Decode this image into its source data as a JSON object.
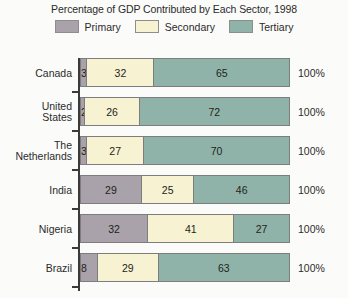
{
  "chart_data": {
    "type": "bar",
    "orientation": "horizontal",
    "stacked": true,
    "normalized": true,
    "title": "Percentage of GDP Contributed by Each Sector, 1998",
    "xlabel": "",
    "ylabel": "",
    "xlim": [
      0,
      100
    ],
    "grid": false,
    "legend_position": "top",
    "categories": [
      "Canada",
      "United\nStates",
      "The\nNetherlands",
      "India",
      "Nigeria",
      "Brazil"
    ],
    "series": [
      {
        "name": "Primary",
        "color": "#a9a2ab",
        "values": [
          3,
          2,
          3,
          29,
          32,
          8
        ]
      },
      {
        "name": "Secondary",
        "color": "#f7f2d2",
        "values": [
          32,
          26,
          27,
          25,
          41,
          29
        ]
      },
      {
        "name": "Tertiary",
        "color": "#8fb3a8",
        "values": [
          65,
          72,
          70,
          46,
          27,
          63
        ]
      }
    ],
    "row_totals": [
      "100%",
      "100%",
      "100%",
      "100%",
      "100%",
      "100%"
    ]
  },
  "legend": {
    "items": [
      {
        "label": "Primary",
        "color": "#a9a2ab"
      },
      {
        "label": "Secondary",
        "color": "#f7f2d2"
      },
      {
        "label": "Tertiary",
        "color": "#8fb3a8"
      }
    ]
  },
  "rows": [
    {
      "label_line1": "Canada",
      "label_line2": "",
      "total": "100%",
      "segments": [
        {
          "sector": "Primary",
          "value": "3",
          "pct": 3
        },
        {
          "sector": "Secondary",
          "value": "32",
          "pct": 32
        },
        {
          "sector": "Tertiary",
          "value": "65",
          "pct": 65
        }
      ]
    },
    {
      "label_line1": "United",
      "label_line2": "States",
      "total": "100%",
      "segments": [
        {
          "sector": "Primary",
          "value": "2",
          "pct": 2
        },
        {
          "sector": "Secondary",
          "value": "26",
          "pct": 26
        },
        {
          "sector": "Tertiary",
          "value": "72",
          "pct": 72
        }
      ]
    },
    {
      "label_line1": "The",
      "label_line2": "Netherlands",
      "total": "100%",
      "segments": [
        {
          "sector": "Primary",
          "value": "3",
          "pct": 3
        },
        {
          "sector": "Secondary",
          "value": "27",
          "pct": 27
        },
        {
          "sector": "Tertiary",
          "value": "70",
          "pct": 70
        }
      ]
    },
    {
      "label_line1": "India",
      "label_line2": "",
      "total": "100%",
      "segments": [
        {
          "sector": "Primary",
          "value": "29",
          "pct": 29
        },
        {
          "sector": "Secondary",
          "value": "25",
          "pct": 25
        },
        {
          "sector": "Tertiary",
          "value": "46",
          "pct": 46
        }
      ]
    },
    {
      "label_line1": "Nigeria",
      "label_line2": "",
      "total": "100%",
      "segments": [
        {
          "sector": "Primary",
          "value": "32",
          "pct": 32
        },
        {
          "sector": "Secondary",
          "value": "41",
          "pct": 41
        },
        {
          "sector": "Tertiary",
          "value": "27",
          "pct": 27
        }
      ]
    },
    {
      "label_line1": "Brazil",
      "label_line2": "",
      "total": "100%",
      "segments": [
        {
          "sector": "Primary",
          "value": "8",
          "pct": 8
        },
        {
          "sector": "Secondary",
          "value": "29",
          "pct": 29
        },
        {
          "sector": "Tertiary",
          "value": "63",
          "pct": 63
        }
      ]
    }
  ]
}
